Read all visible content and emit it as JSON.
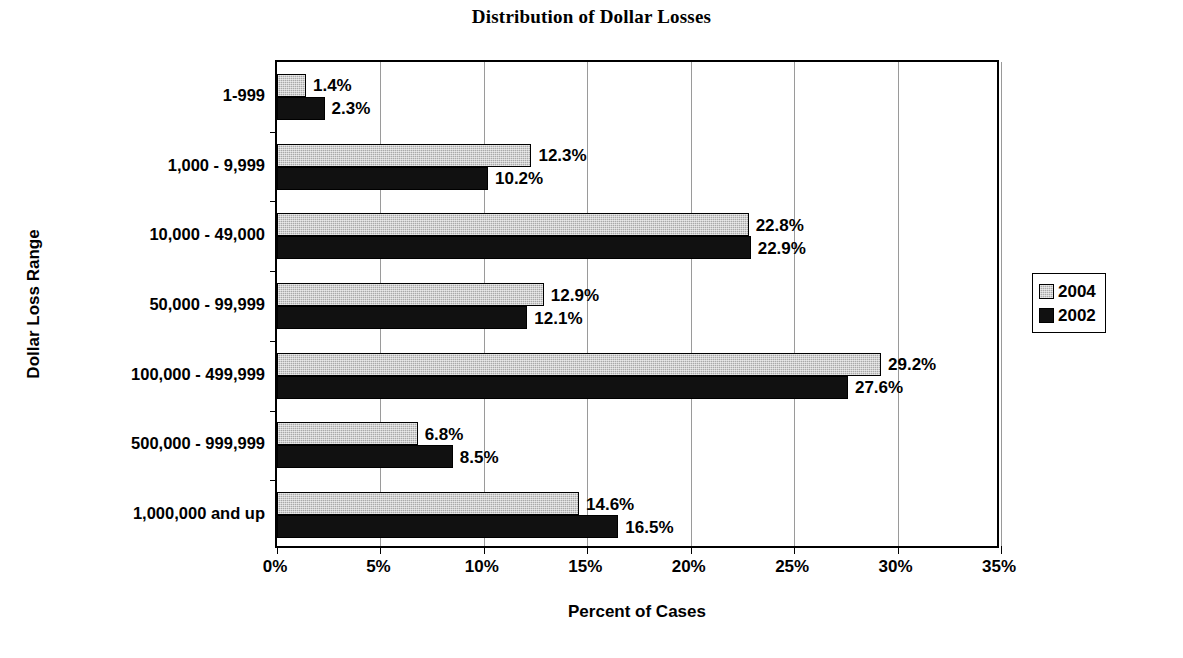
{
  "chart_data": {
    "type": "bar",
    "orientation": "horizontal",
    "title": "Distribution of Dollar Losses",
    "xlabel": "Percent of Cases",
    "ylabel": "Dollar Loss Range",
    "xlim": [
      0,
      35
    ],
    "xticks": [
      0,
      5,
      10,
      15,
      20,
      25,
      30,
      35
    ],
    "xticklabels": [
      "0%",
      "5%",
      "10%",
      "15%",
      "20%",
      "25%",
      "30%",
      "35%"
    ],
    "grid": "vertical",
    "legend_position": "right",
    "categories": [
      "1-999",
      "1,000 - 9,999",
      "10,000 - 49,000",
      "50,000 - 99,999",
      "100,000 - 499,999",
      "500,000 - 999,999",
      "1,000,000 and up"
    ],
    "series": [
      {
        "name": "2004",
        "color": "#a9a9a9",
        "values": [
          1.4,
          12.3,
          22.8,
          12.9,
          29.2,
          6.8,
          14.6
        ],
        "labels": [
          "1.4%",
          "12.3%",
          "22.8%",
          "12.9%",
          "29.2%",
          "6.8%",
          "14.6%"
        ]
      },
      {
        "name": "2002",
        "color": "#111111",
        "values": [
          2.3,
          10.2,
          22.9,
          12.1,
          27.6,
          8.5,
          16.5
        ],
        "labels": [
          "2.3%",
          "10.2%",
          "22.9%",
          "12.1%",
          "27.6%",
          "8.5%",
          "16.5%"
        ]
      }
    ]
  },
  "legend": {
    "items": [
      {
        "label": "2004",
        "swatch": "series-2004"
      },
      {
        "label": "2002",
        "swatch": "series-2002"
      }
    ]
  }
}
